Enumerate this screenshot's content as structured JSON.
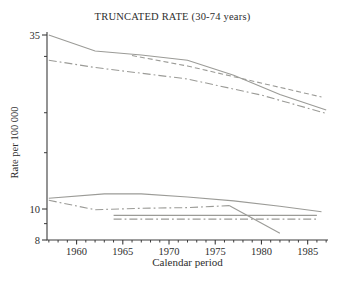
{
  "window": {
    "title": "TRUNCATED RATE (30-74 years)"
  },
  "colors": {
    "background": "#ffffff",
    "line": "#9b9b97",
    "axis": "#3c3c3c",
    "text": "#2e2e2e"
  },
  "chart_data": {
    "type": "line",
    "title": "TRUNCATED RATE (30-74 years)",
    "xlabel": "Calendar period",
    "ylabel": "Rate per 100 000",
    "x_axis": {
      "scale": "linear",
      "range": [
        1956.8,
        1987.2
      ],
      "major_ticks": [
        1960,
        1965,
        1970,
        1975,
        1980,
        1985
      ],
      "minor_tick_years_start": 1957,
      "minor_tick_years_end": 1987,
      "grid": false
    },
    "y_axis": {
      "scale": "log",
      "range": [
        8,
        35
      ],
      "labeled_ticks": [
        35,
        10,
        8
      ],
      "minor_ticks": [
        30,
        20,
        15,
        9
      ],
      "grid": false
    },
    "legend": "none",
    "series": [
      {
        "name": "upper-solid-rate",
        "linestyle": "solid",
        "points": [
          [
            1957,
            35.0
          ],
          [
            1962,
            31.2
          ],
          [
            1967,
            30.3
          ],
          [
            1972,
            29.2
          ],
          [
            1977,
            26.2
          ],
          [
            1982,
            22.8
          ],
          [
            1987,
            20.4
          ]
        ]
      },
      {
        "name": "upper-dashed-rate",
        "linestyle": "dashed",
        "points": [
          [
            1966,
            30.2
          ],
          [
            1972,
            28.0
          ],
          [
            1986.5,
            22.4
          ]
        ]
      },
      {
        "name": "upper-dashdot-rate",
        "linestyle": "dashdot",
        "points": [
          [
            1957,
            29.2
          ],
          [
            1962,
            27.7
          ],
          [
            1972,
            25.5
          ],
          [
            1980,
            22.7
          ],
          [
            1987,
            19.9
          ]
        ]
      },
      {
        "name": "lower-solid-rate",
        "linestyle": "solid",
        "points": [
          [
            1957,
            10.8
          ],
          [
            1963,
            11.15
          ],
          [
            1967,
            11.15
          ],
          [
            1972,
            10.9
          ],
          [
            1977,
            10.6
          ],
          [
            1982,
            10.2
          ],
          [
            1986.5,
            9.8
          ]
        ]
      },
      {
        "name": "lower-dashdot-rate",
        "linestyle": "dashdot",
        "points": [
          [
            1957,
            10.65
          ],
          [
            1962,
            9.95
          ],
          [
            1967,
            10.05
          ],
          [
            1972,
            10.1
          ],
          [
            1976.5,
            10.25
          ]
        ]
      },
      {
        "name": "lower-declining-segment",
        "linestyle": "solid",
        "points": [
          [
            1976.5,
            10.25
          ],
          [
            1982,
            8.4
          ]
        ]
      },
      {
        "name": "lower-flat-solid-rate",
        "linestyle": "solid",
        "points": [
          [
            1964,
            9.55
          ],
          [
            1986,
            9.55
          ]
        ]
      },
      {
        "name": "lower-flat-dashdot-rate",
        "linestyle": "dashdot",
        "points": [
          [
            1964,
            9.3
          ],
          [
            1986,
            9.3
          ]
        ]
      }
    ]
  }
}
